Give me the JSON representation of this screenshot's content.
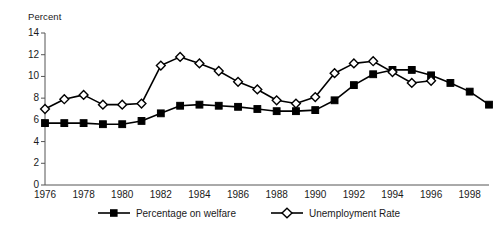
{
  "chart_data": {
    "type": "line",
    "title": "",
    "subtitle": "",
    "xlabel": "",
    "ylabel": "Percent",
    "ylim": [
      0,
      14
    ],
    "xlim": [
      1976,
      1999
    ],
    "grid": false,
    "legend_position": "bottom-center",
    "yticks": [
      0,
      2,
      4,
      6,
      8,
      10,
      12,
      14
    ],
    "ytick_labels": [
      "0",
      "2",
      "4",
      "6",
      "8",
      "10",
      "12",
      "14"
    ],
    "xticks": [
      1976,
      1978,
      1980,
      1982,
      1984,
      1986,
      1988,
      1990,
      1992,
      1994,
      1996,
      1998
    ],
    "xtick_labels": [
      "1976",
      "1978",
      "1980",
      "1982",
      "1984",
      "1986",
      "1988",
      "1990",
      "1992",
      "1994",
      "1996",
      "1998"
    ],
    "series": [
      {
        "name": "Percentage on welfare",
        "marker": "filled-square",
        "color": "#000000",
        "x": [
          1976,
          1977,
          1978,
          1979,
          1980,
          1981,
          1982,
          1983,
          1984,
          1985,
          1986,
          1987,
          1988,
          1989,
          1990,
          1991,
          1992,
          1993,
          1994,
          1995,
          1996,
          1997,
          1998,
          1999
        ],
        "values": [
          5.7,
          5.7,
          5.7,
          5.6,
          5.6,
          5.9,
          6.6,
          7.3,
          7.4,
          7.3,
          7.2,
          7.0,
          6.8,
          6.8,
          6.9,
          7.8,
          9.2,
          10.2,
          10.6,
          10.6,
          10.1,
          9.4,
          8.6,
          7.4
        ]
      },
      {
        "name": "Unemployment Rate",
        "marker": "open-diamond",
        "color": "#000000",
        "x": [
          1976,
          1977,
          1978,
          1979,
          1980,
          1981,
          1982,
          1983,
          1984,
          1985,
          1986,
          1987,
          1988,
          1989,
          1990,
          1991,
          1992,
          1993,
          1994,
          1995,
          1996
        ],
        "values": [
          7.0,
          7.9,
          8.3,
          7.4,
          7.4,
          7.5,
          11.0,
          11.8,
          11.2,
          10.5,
          9.5,
          8.8,
          7.8,
          7.5,
          8.1,
          10.3,
          11.2,
          11.4,
          10.4,
          9.4,
          9.6
        ]
      }
    ]
  },
  "legend": {
    "items": [
      {
        "label": "Percentage on welfare",
        "marker": "filled-square"
      },
      {
        "label": "Unemployment Rate",
        "marker": "open-diamond"
      }
    ]
  }
}
